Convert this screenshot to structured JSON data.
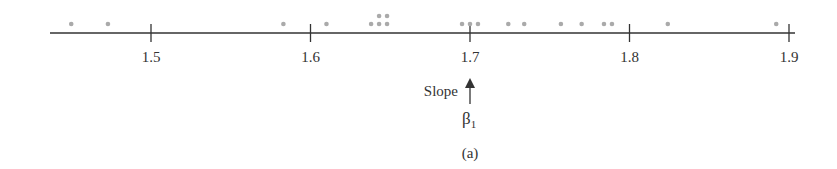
{
  "chart_data": {
    "type": "scatter",
    "subtype": "dot-plot",
    "title": "",
    "xlabel": "",
    "ylabel": "",
    "xlim": [
      1.438,
      1.9
    ],
    "xticks": [
      1.5,
      1.6,
      1.7,
      1.8,
      1.9
    ],
    "tick_labels": [
      "1.5",
      "1.6",
      "1.7",
      "1.8",
      "1.9"
    ],
    "grid": false,
    "legend": null,
    "points": [
      {
        "x": 1.45,
        "stack": 0
      },
      {
        "x": 1.473,
        "stack": 0
      },
      {
        "x": 1.583,
        "stack": 0
      },
      {
        "x": 1.61,
        "stack": 0
      },
      {
        "x": 1.638,
        "stack": 0
      },
      {
        "x": 1.643,
        "stack": 0
      },
      {
        "x": 1.643,
        "stack": 1
      },
      {
        "x": 1.648,
        "stack": 0
      },
      {
        "x": 1.648,
        "stack": 1
      },
      {
        "x": 1.695,
        "stack": 0
      },
      {
        "x": 1.7,
        "stack": 0
      },
      {
        "x": 1.705,
        "stack": 0
      },
      {
        "x": 1.724,
        "stack": 0
      },
      {
        "x": 1.734,
        "stack": 0
      },
      {
        "x": 1.757,
        "stack": 0
      },
      {
        "x": 1.77,
        "stack": 0
      },
      {
        "x": 1.784,
        "stack": 0
      },
      {
        "x": 1.789,
        "stack": 0
      },
      {
        "x": 1.824,
        "stack": 0
      },
      {
        "x": 1.892,
        "stack": 0
      }
    ],
    "annotations": [
      {
        "text": "Slope",
        "x": 1.7,
        "arrow": "up"
      },
      {
        "text": "β",
        "subscript": "1",
        "x": 1.7
      }
    ],
    "caption": "(a)",
    "colors": {
      "dots": "#aaaaaa",
      "axis": "#333333"
    }
  },
  "labels": {
    "ticks": [
      "1.5",
      "1.6",
      "1.7",
      "1.8",
      "1.9"
    ],
    "slope": "Slope",
    "beta": "β",
    "beta_sub": "1",
    "caption": "(a)"
  }
}
